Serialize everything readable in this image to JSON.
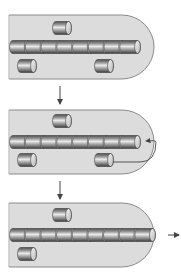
{
  "diagram": {
    "type": "process-sequence",
    "colors": {
      "background": "#ffffff",
      "chamber_fill": "#dcdcdc",
      "chamber_stroke": "#8a8a8a",
      "cylinder_dark": "#5a5a5a",
      "cylinder_mid": "#a8a8a8",
      "cylinder_light": "#e8e8e8",
      "arrow": "#444444"
    },
    "panels": [
      {
        "name": "stage-1",
        "top": 15,
        "height": 64,
        "filament_units": 8,
        "filament_end_x": 138,
        "free_subunits": [
          {
            "cx": 62,
            "cy": 28
          },
          {
            "cx": 27,
            "cy": 66
          },
          {
            "cx": 104,
            "cy": 66
          }
        ],
        "recycle_arrow": false,
        "exit_arrow": false
      },
      {
        "name": "stage-2",
        "top": 110,
        "height": 64,
        "filament_units": 8,
        "filament_end_x": 138,
        "free_subunits": [
          {
            "cx": 62,
            "cy": 121
          },
          {
            "cx": 27,
            "cy": 160
          },
          {
            "cx": 104,
            "cy": 160
          }
        ],
        "recycle_arrow": true,
        "exit_arrow": false
      },
      {
        "name": "stage-3",
        "top": 203,
        "height": 64,
        "filament_units": 9,
        "filament_end_x": 153,
        "free_subunits": [
          {
            "cx": 62,
            "cy": 215
          },
          {
            "cx": 27,
            "cy": 254
          }
        ],
        "recycle_arrow": false,
        "exit_arrow": true
      }
    ],
    "transition_arrows": [
      {
        "x": 60,
        "y1": 86,
        "y2": 104
      },
      {
        "x": 60,
        "y1": 181,
        "y2": 199
      }
    ]
  }
}
